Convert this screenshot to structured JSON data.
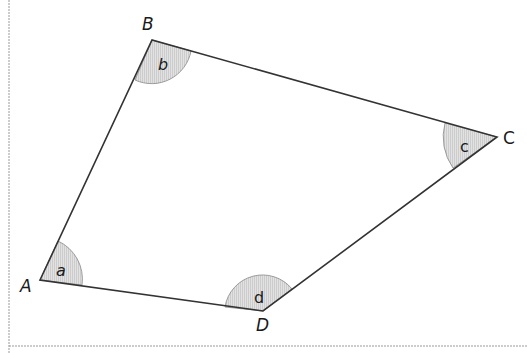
{
  "diagram": {
    "type": "quadrilateral",
    "vertices": [
      {
        "name": "A",
        "x": 40,
        "y": 280,
        "angle_label": "a"
      },
      {
        "name": "B",
        "x": 152,
        "y": 40,
        "angle_label": "b"
      },
      {
        "name": "C",
        "x": 497,
        "y": 137,
        "angle_label": "c"
      },
      {
        "name": "D",
        "x": 263,
        "y": 311,
        "angle_label": "d"
      }
    ],
    "labels": {
      "A": "A",
      "B": "B",
      "C": "C",
      "D": "D",
      "a": "a",
      "b": "b",
      "c": "c",
      "d": "d"
    },
    "colors": {
      "line": "#333333",
      "angle_fill": "#d9d9d9",
      "border": "#999999"
    }
  }
}
